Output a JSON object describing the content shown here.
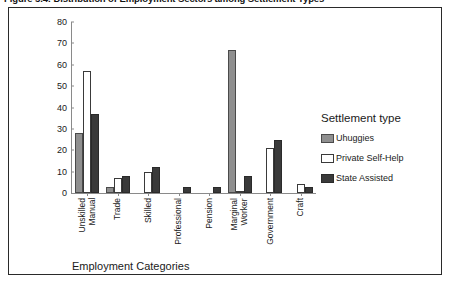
{
  "caption": {
    "text": "Figure 5.4:  Distribution of Employment Sectors among Settlement Types"
  },
  "chart_data": {
    "type": "bar",
    "title": "",
    "xlabel": "Employment Categories",
    "ylabel": "",
    "ylim": [
      0,
      80
    ],
    "yticks": [
      0,
      10,
      20,
      30,
      40,
      50,
      60,
      70,
      80
    ],
    "grid": false,
    "legend_position": "right",
    "legend_title": "Settlement type",
    "categories": [
      "Unskilled\nManual",
      "Trade",
      "Skilled",
      "Professional",
      "Pension",
      "Marginal\nWorker",
      "Government",
      "Craft"
    ],
    "series": [
      {
        "name": "Uhuggies",
        "color": "#8f8f8f",
        "values": [
          28,
          3,
          0,
          0,
          0,
          67,
          0,
          0
        ]
      },
      {
        "name": "Private Self-Help",
        "color": "#ffffff",
        "values": [
          57,
          7,
          10,
          0,
          0,
          1,
          21,
          4
        ]
      },
      {
        "name": "State Assisted",
        "color": "#3a3a3a",
        "values": [
          37,
          8,
          12,
          3,
          3,
          8,
          25,
          3
        ]
      }
    ]
  },
  "axis": {
    "tick_labels": [
      "80",
      "70",
      "60",
      "50",
      "40",
      "30",
      "20",
      "10",
      "0"
    ]
  }
}
